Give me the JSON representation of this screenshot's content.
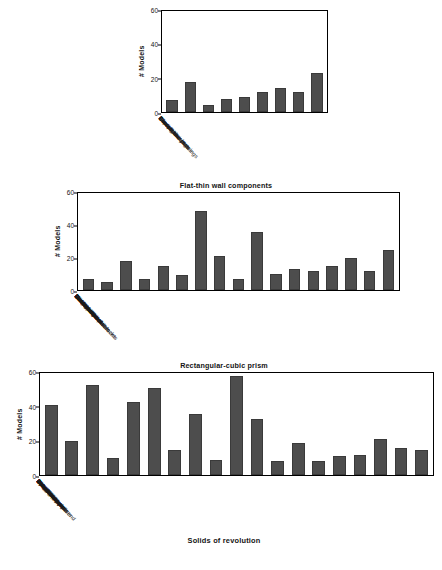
{
  "figure": {
    "axis_caption": "Solids of revolution"
  },
  "charts": [
    {
      "title": "",
      "ylabel": "# Models",
      "yticks": [
        "0",
        "20",
        "40",
        "60"
      ]
    },
    {
      "title": "Flat-thin wall components",
      "ylabel": "# Models",
      "yticks": [
        "0",
        "20",
        "40",
        "60"
      ]
    },
    {
      "title": "Rectangular-cubic prism",
      "ylabel": "# Models",
      "yticks": [
        "0",
        "20",
        "40",
        "60"
      ]
    }
  ],
  "chart_data": [
    {
      "type": "bar",
      "title": "",
      "xlabel": "",
      "ylabel": "# Models",
      "ylim": [
        0,
        60
      ],
      "yticks": [
        0,
        20,
        40,
        60
      ],
      "grid": false,
      "legend": null,
      "bar_color": "#4d4d4d",
      "categories": [
        "Bearings",
        "Bracket like parts",
        "Clips",
        "Contact switches",
        "Curved housings",
        "Miscellaneous",
        "Rectangular housings",
        "Slender thin plates",
        "Thin plates"
      ],
      "values": [
        7,
        18,
        4,
        8,
        9,
        12,
        14,
        12,
        23
      ]
    },
    {
      "type": "bar",
      "title": "Flat-thin wall components",
      "xlabel": "",
      "ylabel": "# Models",
      "ylim": [
        0,
        60
      ],
      "yticks": [
        0,
        20,
        40,
        60
      ],
      "grid": false,
      "legend": null,
      "bar_color": "#4d4d4d",
      "categories": [
        "Bearing blocks",
        "Contoured surfaces",
        "Handles",
        "L-blocks",
        "Long machine elements",
        "Machined blocks",
        "Machined plates",
        "Miscellaneous",
        "Motor bodies",
        "Prismatic stock",
        "Rocker arms",
        "Slender links",
        "Small machined blocks",
        "T shaped parts",
        "Thick plates",
        "Thick slotted plates",
        "U shaped parts"
      ],
      "values": [
        7,
        5,
        18,
        7,
        15,
        9,
        49,
        21,
        7,
        36,
        10,
        13,
        12,
        15,
        20,
        12,
        25
      ]
    },
    {
      "type": "bar",
      "title": "Rectangular-cubic prism",
      "xlabel": "Solids of revolution",
      "ylabel": "# Models",
      "ylim": [
        0,
        60
      ],
      "yticks": [
        0,
        20,
        40,
        60
      ],
      "grid": false,
      "legend": null,
      "bar_color": "#4d4d4d",
      "categories": [
        "90° elbows",
        "Bearing like parts",
        "Bolt like parts",
        "Container like parts",
        "Cylindrical parts",
        "Discs",
        "Flange like parts",
        "Gear like parts",
        "Intersecting pipes",
        "Long pins",
        "Miscellaneous",
        "Non-90° elbows",
        "Nuts",
        "Oil pans",
        "Ports",
        "Pulley like parts",
        "Round change fit end",
        "Simple pipes",
        "Spoked wheels"
      ],
      "values": [
        41,
        20,
        53,
        10,
        43,
        51,
        15,
        36,
        9,
        58,
        33,
        8,
        19,
        8,
        11,
        12,
        21,
        16,
        15
      ]
    }
  ]
}
